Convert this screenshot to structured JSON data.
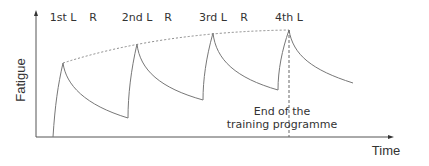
{
  "diagram": {
    "title": "",
    "y_axis_label": "Fatigue",
    "x_axis_label": "Time",
    "phase_labels": [
      {
        "text": "1st L",
        "x": 63
      },
      {
        "text": "R",
        "x": 93
      },
      {
        "text": "2nd L",
        "x": 137
      },
      {
        "text": "R",
        "x": 168
      },
      {
        "text": "3rd L",
        "x": 213
      },
      {
        "text": "R",
        "x": 244
      },
      {
        "text": "4th L",
        "x": 289
      }
    ],
    "annotation": {
      "line1": "End of the",
      "line2": "training programme"
    },
    "colors": {
      "line": "#777777",
      "text": "#333333"
    }
  }
}
